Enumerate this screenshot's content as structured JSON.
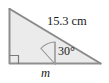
{
  "figure": {
    "kind": "geometry-diagram",
    "shape": "right-triangle",
    "labels": {
      "hypotenuse": "15.3 cm",
      "angle": "30°",
      "base": "m"
    },
    "colors": {
      "fill": "#ebebeb",
      "stroke": "#8c8c8c",
      "stroke_dark": "#6e6e6e",
      "text": "#1a1a1a",
      "background": "#ffffff"
    },
    "geometry": {
      "apex_top": [
        9,
        8
      ],
      "right_angle_vertex": [
        9,
        64
      ],
      "right_vertex": [
        101,
        64
      ],
      "angle_vertex": [
        55,
        64
      ],
      "angle_degrees": 30,
      "hypotenuse_length_cm": 15.3,
      "right_angle_marker_size": 9,
      "arc_radius": 22
    }
  }
}
